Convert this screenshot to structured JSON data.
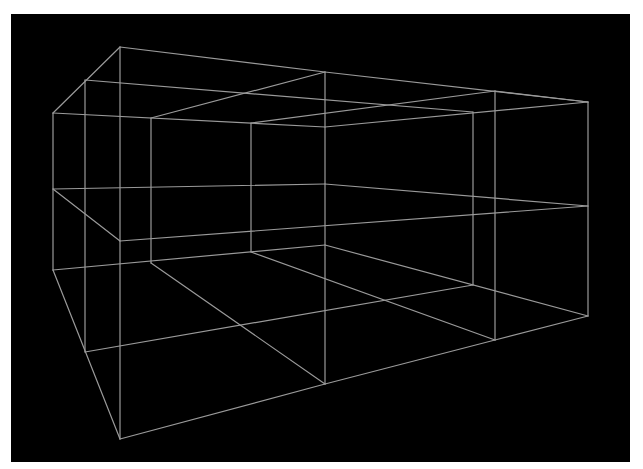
{
  "figure": {
    "background_color": "#000000",
    "line_color": "#9a9a9a",
    "canvas": {
      "x": 11,
      "y": 14,
      "width": 619,
      "height": 448
    }
  },
  "segments": [
    {
      "x1": 120,
      "y1": 47,
      "x2": 325,
      "y2": 72
    },
    {
      "x1": 325,
      "y1": 72,
      "x2": 588,
      "y2": 102
    },
    {
      "x1": 120,
      "y1": 47,
      "x2": 53,
      "y2": 113
    },
    {
      "x1": 85,
      "y1": 80,
      "x2": 473,
      "y2": 112
    },
    {
      "x1": 53,
      "y1": 113,
      "x2": 325,
      "y2": 127
    },
    {
      "x1": 325,
      "y1": 127,
      "x2": 588,
      "y2": 102
    },
    {
      "x1": 151,
      "y1": 118,
      "x2": 325,
      "y2": 72
    },
    {
      "x1": 251,
      "y1": 123,
      "x2": 495,
      "y2": 91
    },
    {
      "x1": 495,
      "y1": 91,
      "x2": 588,
      "y2": 102
    },
    {
      "x1": 53,
      "y1": 113,
      "x2": 53,
      "y2": 270
    },
    {
      "x1": 85,
      "y1": 80,
      "x2": 85,
      "y2": 352
    },
    {
      "x1": 120,
      "y1": 47,
      "x2": 120,
      "y2": 439
    },
    {
      "x1": 151,
      "y1": 118,
      "x2": 151,
      "y2": 263
    },
    {
      "x1": 251,
      "y1": 123,
      "x2": 251,
      "y2": 252
    },
    {
      "x1": 325,
      "y1": 72,
      "x2": 325,
      "y2": 384
    },
    {
      "x1": 473,
      "y1": 112,
      "x2": 473,
      "y2": 285
    },
    {
      "x1": 495,
      "y1": 91,
      "x2": 495,
      "y2": 340
    },
    {
      "x1": 588,
      "y1": 102,
      "x2": 588,
      "y2": 316
    },
    {
      "x1": 53,
      "y1": 189,
      "x2": 325,
      "y2": 184
    },
    {
      "x1": 325,
      "y1": 184,
      "x2": 588,
      "y2": 206
    },
    {
      "x1": 53,
      "y1": 189,
      "x2": 120,
      "y2": 241
    },
    {
      "x1": 120,
      "y1": 241,
      "x2": 588,
      "y2": 206
    },
    {
      "x1": 53,
      "y1": 270,
      "x2": 325,
      "y2": 245
    },
    {
      "x1": 325,
      "y1": 245,
      "x2": 588,
      "y2": 316
    },
    {
      "x1": 151,
      "y1": 263,
      "x2": 325,
      "y2": 384
    },
    {
      "x1": 251,
      "y1": 252,
      "x2": 495,
      "y2": 340
    },
    {
      "x1": 85,
      "y1": 352,
      "x2": 473,
      "y2": 285
    },
    {
      "x1": 53,
      "y1": 270,
      "x2": 120,
      "y2": 439
    },
    {
      "x1": 120,
      "y1": 439,
      "x2": 325,
      "y2": 384
    },
    {
      "x1": 325,
      "y1": 384,
      "x2": 495,
      "y2": 340
    },
    {
      "x1": 495,
      "y1": 340,
      "x2": 588,
      "y2": 316
    }
  ],
  "caption": ""
}
